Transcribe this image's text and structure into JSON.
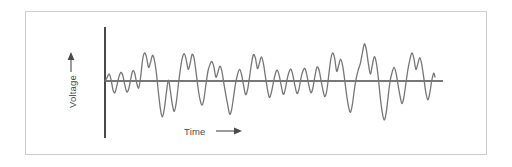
{
  "figure": {
    "background_color": "#ffffff",
    "border_color": "#cdcdcd",
    "axis_color": "#4a4a4a",
    "trace_color": "#767676"
  },
  "labels": {
    "y_axis": "Voltage",
    "x_axis": "Time",
    "y_arrow_icon": "arrow-up-icon",
    "x_arrow_icon": "arrow-right-icon"
  },
  "chart_data": {
    "type": "line",
    "title": "",
    "subtitle": "",
    "xlabel": "Time",
    "ylabel": "Voltage",
    "legend": [],
    "annotations": [],
    "grid": false,
    "x_tick_labels": [],
    "y_tick_labels": [],
    "xlim": [
      0,
      100
    ],
    "ylim": [
      -1,
      1
    ],
    "series": [
      {
        "name": "signal",
        "color": "#767676",
        "x": [
          0.0,
          0.6,
          1.2,
          1.8,
          2.4,
          3.0,
          3.6,
          4.2,
          4.8,
          5.4,
          6.0,
          6.6,
          7.2,
          7.8,
          8.4,
          9.0,
          9.6,
          10.2,
          10.8,
          11.4,
          12.0,
          12.6,
          13.2,
          13.8,
          14.4,
          15.0,
          15.6,
          16.2,
          16.8,
          17.4,
          18.0,
          18.6,
          19.2,
          19.8,
          20.4,
          21.0,
          21.6,
          22.2,
          22.8,
          23.4,
          24.0,
          24.6,
          25.2,
          25.8,
          26.4,
          27.0,
          27.6,
          28.2,
          28.8,
          29.4,
          30.0,
          30.6,
          31.2,
          31.8,
          32.4,
          33.0,
          33.6,
          34.2,
          34.8,
          35.4,
          36.0,
          36.6,
          37.2,
          37.8,
          38.4,
          39.0,
          39.6,
          40.2,
          40.8,
          41.4,
          42.0,
          42.6,
          43.2,
          43.8,
          44.4,
          45.0,
          45.6,
          46.2,
          46.8,
          47.4,
          48.0,
          48.6,
          49.2,
          49.8,
          50.4,
          51.0,
          51.6,
          52.2,
          52.8,
          53.4,
          54.0,
          54.6,
          55.2,
          55.8,
          56.4,
          57.0,
          57.6,
          58.2,
          58.8,
          59.4,
          60.0,
          60.6,
          61.2,
          61.8,
          62.4,
          63.0,
          63.6,
          64.2,
          64.8,
          65.4,
          66.0,
          66.6,
          67.2,
          67.8,
          68.4,
          69.0,
          69.6,
          70.2,
          70.8,
          71.4,
          72.0,
          72.6,
          73.2,
          73.8,
          74.4,
          75.0,
          75.6,
          76.2,
          76.8,
          77.4,
          78.0,
          78.6,
          79.2,
          79.8,
          80.4,
          81.0,
          81.6,
          82.2,
          82.8,
          83.4,
          84.0,
          84.6,
          85.2,
          85.8,
          86.4,
          87.0,
          87.6,
          88.2,
          88.8,
          89.4,
          90.0,
          90.6,
          91.2,
          91.8,
          92.4,
          93.0,
          93.6,
          94.2,
          94.8,
          95.4,
          96.0,
          96.6,
          97.2,
          97.8,
          98.4,
          99.0,
          99.6,
          100.0
        ],
        "y": [
          0.0,
          0.08,
          0.18,
          0.05,
          -0.22,
          -0.3,
          -0.12,
          0.1,
          0.22,
          0.14,
          -0.1,
          -0.28,
          -0.2,
          0.05,
          0.26,
          0.2,
          -0.05,
          -0.18,
          0.1,
          0.55,
          0.72,
          0.6,
          0.35,
          0.48,
          0.66,
          0.52,
          0.18,
          -0.3,
          -0.72,
          -0.92,
          -0.7,
          -0.3,
          0.02,
          -0.25,
          -0.6,
          -0.78,
          -0.55,
          -0.12,
          0.28,
          0.58,
          0.7,
          0.55,
          0.3,
          0.45,
          0.68,
          0.58,
          0.22,
          -0.18,
          -0.48,
          -0.62,
          -0.45,
          -0.08,
          0.25,
          0.42,
          0.5,
          0.36,
          0.1,
          0.22,
          0.38,
          0.26,
          -0.05,
          -0.35,
          -0.62,
          -0.85,
          -0.72,
          -0.38,
          -0.05,
          0.18,
          0.3,
          0.16,
          -0.12,
          -0.35,
          -0.22,
          0.1,
          0.45,
          0.68,
          0.58,
          0.32,
          0.46,
          0.62,
          0.45,
          0.12,
          -0.2,
          -0.42,
          -0.3,
          -0.05,
          0.18,
          0.28,
          0.14,
          -0.12,
          -0.34,
          -0.22,
          0.05,
          0.24,
          0.3,
          0.12,
          -0.14,
          -0.32,
          -0.2,
          0.08,
          0.26,
          0.32,
          0.14,
          -0.12,
          -0.3,
          -0.18,
          0.12,
          0.35,
          0.3,
          0.05,
          -0.22,
          -0.4,
          -0.25,
          0.15,
          0.55,
          0.72,
          0.58,
          0.25,
          0.4,
          0.56,
          0.4,
          0.05,
          -0.35,
          -0.66,
          -0.8,
          -0.58,
          -0.2,
          0.1,
          0.3,
          0.46,
          0.72,
          0.95,
          0.8,
          0.45,
          0.18,
          0.4,
          0.62,
          0.48,
          0.1,
          -0.4,
          -0.8,
          -1.0,
          -0.82,
          -0.4,
          0.0,
          0.22,
          0.35,
          0.2,
          -0.1,
          -0.38,
          -0.58,
          -0.4,
          -0.05,
          0.3,
          0.55,
          0.72,
          0.58,
          0.3,
          0.44,
          0.6,
          0.42,
          0.08,
          -0.28,
          -0.48,
          -0.32,
          0.0,
          0.2,
          0.1
        ]
      }
    ]
  }
}
